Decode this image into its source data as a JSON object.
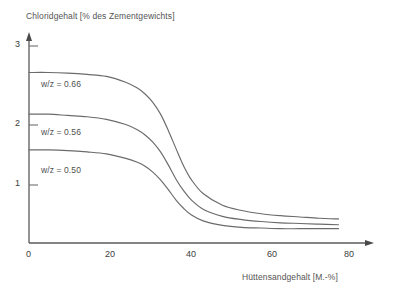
{
  "chart_data": {
    "type": "line",
    "title": "Chloridgehalt [% des Zementgewichts]",
    "xlabel": "Hüttensandgehalt  [M.-%]",
    "ylabel": "Chloridgehalt [% des Zementgewichts]",
    "xlim": [
      0,
      84
    ],
    "ylim": [
      0,
      3.15
    ],
    "grid": false,
    "legend_position": "inline-annotations",
    "xticks": [
      0,
      20,
      40,
      60,
      80
    ],
    "xtick_labels": [
      "0",
      "20",
      "40",
      "60",
      "80"
    ],
    "yticks": [
      1,
      2,
      3
    ],
    "ytick_labels": [
      "1",
      "2",
      "3"
    ],
    "x": [
      0,
      5,
      10,
      15,
      20,
      25,
      28,
      30,
      32,
      34,
      36,
      38,
      40,
      42,
      45,
      50,
      55,
      60,
      65,
      70,
      75,
      80
    ],
    "series": [
      {
        "name": "w/z = 0.66",
        "label": "w/z = 0.66",
        "color": "#6b6b6b",
        "values": [
          2.62,
          2.62,
          2.61,
          2.59,
          2.56,
          2.47,
          2.38,
          2.29,
          2.16,
          1.98,
          1.73,
          1.45,
          1.18,
          0.97,
          0.76,
          0.58,
          0.5,
          0.45,
          0.42,
          0.4,
          0.38,
          0.37
        ]
      },
      {
        "name": "w/z = 0.56",
        "label": "w/z = 0.56",
        "color": "#6b6b6b",
        "values": [
          1.98,
          1.98,
          1.96,
          1.94,
          1.9,
          1.82,
          1.74,
          1.66,
          1.55,
          1.4,
          1.2,
          0.98,
          0.8,
          0.66,
          0.52,
          0.41,
          0.36,
          0.33,
          0.31,
          0.3,
          0.29,
          0.28
        ]
      },
      {
        "name": "w/z = 0.50",
        "label": "w/z = 0.50",
        "color": "#6b6b6b",
        "values": [
          1.43,
          1.43,
          1.42,
          1.4,
          1.37,
          1.3,
          1.24,
          1.18,
          1.09,
          0.97,
          0.82,
          0.66,
          0.53,
          0.43,
          0.34,
          0.27,
          0.24,
          0.23,
          0.22,
          0.22,
          0.22,
          0.22
        ]
      }
    ],
    "annotations": [
      {
        "text": "w/z = 0.66",
        "x_px": 41,
        "y_px": 79
      },
      {
        "text": "w/z = 0.56",
        "x_px": 41,
        "y_px": 127
      },
      {
        "text": "w/z = 0.50",
        "x_px": 41,
        "y_px": 165
      }
    ],
    "axis_color": "#5a5a5a",
    "line_color": "#6b6b6b"
  }
}
